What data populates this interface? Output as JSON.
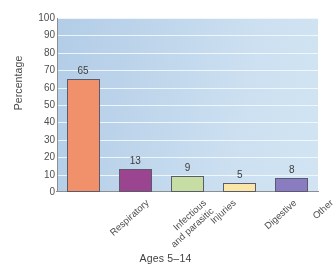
{
  "chart_data": {
    "type": "bar",
    "title": "",
    "subtitle": "",
    "xlabel": "Ages 5–14",
    "ylabel": "Percentage",
    "categories": [
      "Respiratory",
      "Infectious and parasitic",
      "Injuries",
      "Digestive",
      "Other"
    ],
    "category_lines": [
      [
        "Respiratory"
      ],
      [
        "Infectious",
        "and parasitic"
      ],
      [
        "Injuries"
      ],
      [
        "Digestive"
      ],
      [
        "Other"
      ]
    ],
    "values": [
      65,
      13,
      9,
      5,
      8
    ],
    "value_labels": [
      "65",
      "13",
      "9",
      "5",
      "8"
    ],
    "ylim": [
      0,
      100
    ],
    "ytick_labels": [
      "100",
      "90",
      "80",
      "70",
      "60",
      "50",
      "40",
      "30",
      "20",
      "10",
      "0"
    ],
    "ytick_values": [
      100,
      90,
      80,
      70,
      60,
      50,
      40,
      30,
      20,
      10,
      0
    ],
    "grid": true,
    "grid_orientation": "horizontal",
    "legend": "none",
    "bar_colors": [
      "#f2906a",
      "#9d4392",
      "#c6dda2",
      "#fbe7a6",
      "#8a7cc2"
    ],
    "bar_border_color": "#5b5b6b",
    "plot_background": "#bdd6ec",
    "gridline_color": "#f2f8fd",
    "axis_color": "#8e8e8e",
    "text_color": "#4a4a4a"
  }
}
